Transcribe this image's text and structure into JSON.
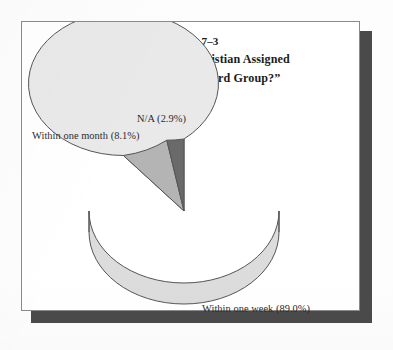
{
  "figure": {
    "exhibit_number": "Exhibit 7–3",
    "question_line_1": "“When Is the New Christian Assigned",
    "question_line_2": "to a Deacon or Shepherd Group?”"
  },
  "labels": {
    "na": "N/A (2.9%)",
    "within_one_month": "Within one month (8.1%)",
    "within_one_week": "Within one week (89.0%)"
  },
  "colors": {
    "slice_week": "#e9e9e9",
    "slice_month": "#b4b4b4",
    "slice_na": "#6a6a6a",
    "slice_week_side": "#dcdcdc",
    "outline": "#555555",
    "paper": "#ffffff",
    "paper_border": "#8a8a8a",
    "paper_shadow": "#4a4a4a",
    "text": "#1b1b1b"
  },
  "chart_data": {
    "type": "pie",
    "title": "Exhibit 7–3 “When Is the New Christian Assigned to a Deacon or Shepherd Group?”",
    "xlabel": "",
    "ylabel": "",
    "grid": false,
    "legend_position": "callout-labels",
    "three_d": true,
    "start_angle_deg": 90,
    "direction": "counterclockwise",
    "categories": [
      "Within one week",
      "Within one month",
      "N/A"
    ],
    "values": [
      89.0,
      8.1,
      2.9
    ],
    "units": "percent",
    "slice_colors": [
      "#e9e9e9",
      "#b4b4b4",
      "#6a6a6a"
    ],
    "data_labels": [
      "Within one week (89.0%)",
      "Within one month (8.1%)",
      "N/A (2.9%)"
    ]
  }
}
